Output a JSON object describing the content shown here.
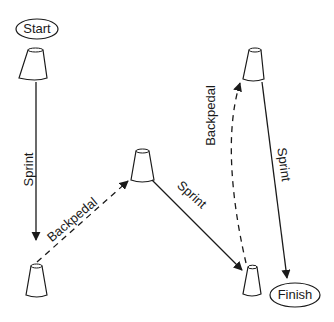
{
  "diagram": {
    "type": "drill-course",
    "nodes": {
      "start": {
        "label": "Start"
      },
      "finish": {
        "label": "Finish"
      },
      "cones": [
        {
          "id": "cone-1",
          "position": "top-left"
        },
        {
          "id": "cone-2",
          "position": "bottom-left"
        },
        {
          "id": "cone-3",
          "position": "middle"
        },
        {
          "id": "cone-4",
          "position": "top-right"
        },
        {
          "id": "cone-5",
          "position": "bottom-right"
        }
      ]
    },
    "paths": [
      {
        "from": "cone-1",
        "to": "cone-2",
        "label": "Sprint",
        "style": "solid"
      },
      {
        "from": "cone-2",
        "to": "cone-3",
        "label": "Backpedal",
        "style": "dashed"
      },
      {
        "from": "cone-3",
        "to": "cone-5",
        "label": "Sprint",
        "style": "solid"
      },
      {
        "from": "cone-5",
        "to": "cone-4",
        "label": "Backpedal",
        "style": "dashed"
      },
      {
        "from": "cone-4",
        "to": "finish",
        "label": "Sprint",
        "style": "solid"
      }
    ],
    "colors": {
      "stroke": "#1a1a1a",
      "background": "#ffffff"
    }
  }
}
